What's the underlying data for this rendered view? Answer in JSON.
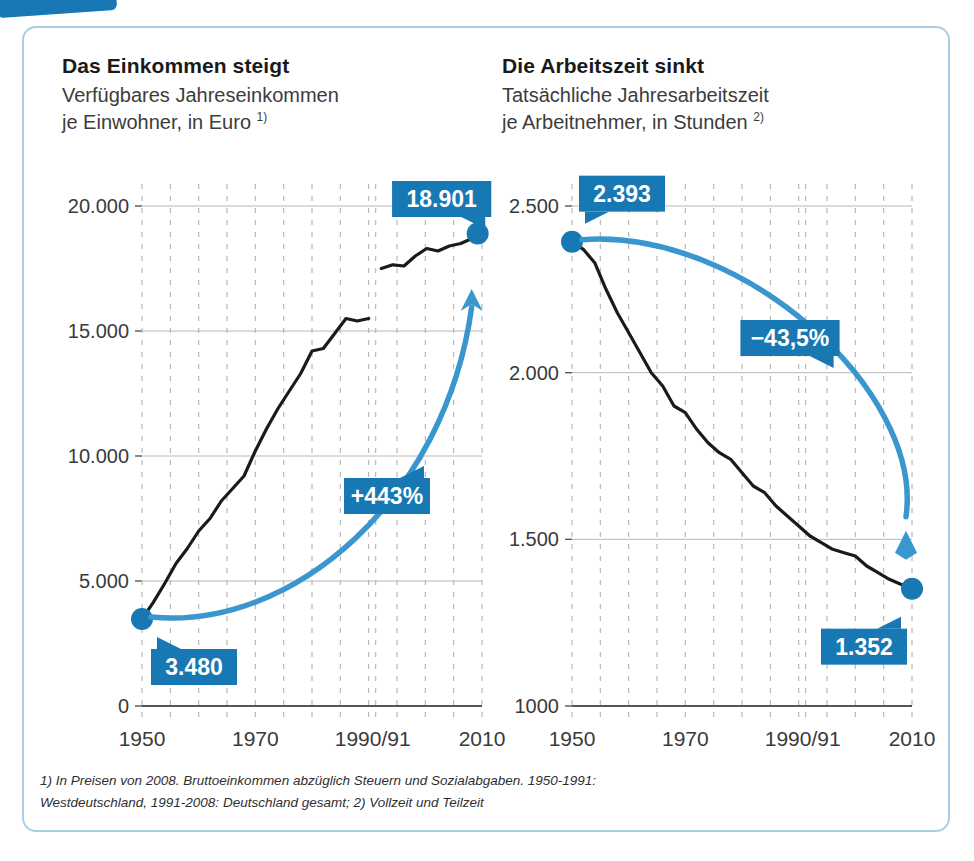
{
  "accent": {
    "badge_blue": "#1878b4",
    "arrow_blue": "#3a96ce",
    "line_black": "#1a1a1a",
    "grid_gray": "#b8b8b8",
    "axis_gray": "#555555",
    "card_border": "#a9cfe5"
  },
  "panels": [
    {
      "id": "einkommen",
      "title": "Das Einkommen steigt",
      "subtitle_line1": "Verfügbares Jahreseinkommen",
      "subtitle_line2": "je Einwohner, in Euro",
      "footnote_marker": "1)"
    },
    {
      "id": "arbeitszeit",
      "title": "Die Arbeitszeit sinkt",
      "subtitle_line1": "Tatsächliche Jahresarbeitszeit",
      "subtitle_line2": "je Arbeitnehmer, in Stunden",
      "footnote_marker": "2)"
    }
  ],
  "footnote": {
    "line1": "1) In Preisen von 2008. Bruttoeinkommen abzüglich Steuern und Sozialabgaben. 1950-1991:",
    "line2": "Westdeutschland, 1991-2008: Deutschland gesamt; 2) Vollzeit und Teilzeit"
  },
  "chart_data": [
    {
      "type": "line",
      "id": "einkommen",
      "title": "Das Einkommen steigt",
      "subtitle": "Verfügbares Jahreseinkommen je Einwohner, in Euro",
      "xlabel": "",
      "ylabel": "Euro",
      "ylim": [
        0,
        20000
      ],
      "xlim": [
        1950,
        2010
      ],
      "yticks": [
        0,
        5000,
        10000,
        15000,
        20000
      ],
      "ytick_labels": [
        "0",
        "5.000",
        "10.000",
        "15.000",
        "20.000"
      ],
      "xticks": [
        1950,
        1970,
        1990,
        2010
      ],
      "xtick_labels": [
        "1950",
        "1970",
        "1990/91",
        "2010"
      ],
      "grid": true,
      "grid_style": "dashed-vertical-and-solid-horizontal",
      "series_break_at": "1990/91",
      "start_value": 3480,
      "end_value": 18901,
      "change_label": "+443%",
      "start_label": "3.480",
      "end_label": "18.901",
      "x": [
        1950,
        1952,
        1954,
        1956,
        1958,
        1960,
        1962,
        1964,
        1966,
        1968,
        1970,
        1972,
        1974,
        1976,
        1978,
        1980,
        1982,
        1984,
        1986,
        1988,
        1990,
        1991,
        1993,
        1995,
        1997,
        1999,
        2001,
        2003,
        2005,
        2007,
        2008
      ],
      "values": [
        3480,
        4150,
        4900,
        5700,
        6300,
        7000,
        7500,
        8200,
        8700,
        9200,
        10200,
        11100,
        11900,
        12600,
        13300,
        14200,
        14300,
        14900,
        15500,
        15400,
        15500,
        17500,
        17650,
        17600,
        18000,
        18300,
        18200,
        18400,
        18500,
        18700,
        18901
      ]
    },
    {
      "type": "line",
      "id": "arbeitszeit",
      "title": "Die Arbeitszeit sinkt",
      "subtitle": "Tatsächliche Jahresarbeitszeit je Arbeitnehmer, in Stunden",
      "xlabel": "",
      "ylabel": "Stunden",
      "ylim": [
        1000,
        2500
      ],
      "xlim": [
        1950,
        2010
      ],
      "yticks": [
        1000,
        1500,
        2000,
        2500
      ],
      "ytick_labels": [
        "1000",
        "1.500",
        "2.000",
        "2.500"
      ],
      "xticks": [
        1950,
        1970,
        1990,
        2010
      ],
      "xtick_labels": [
        "1950",
        "1970",
        "1990/91",
        "2010"
      ],
      "grid": true,
      "grid_style": "dashed-vertical-and-solid-horizontal",
      "start_value": 2393,
      "end_value": 1352,
      "change_label": "−43,5%",
      "start_label": "2.393",
      "end_label": "1.352",
      "x": [
        1950,
        1952,
        1954,
        1956,
        1958,
        1960,
        1962,
        1964,
        1966,
        1968,
        1970,
        1972,
        1974,
        1976,
        1978,
        1980,
        1982,
        1984,
        1986,
        1988,
        1990,
        1992,
        1994,
        1996,
        1998,
        2000,
        2002,
        2004,
        2006,
        2008,
        2010
      ],
      "values": [
        2393,
        2370,
        2330,
        2250,
        2180,
        2120,
        2060,
        2000,
        1960,
        1900,
        1880,
        1830,
        1790,
        1760,
        1740,
        1700,
        1660,
        1640,
        1600,
        1570,
        1540,
        1510,
        1490,
        1470,
        1460,
        1450,
        1420,
        1400,
        1380,
        1365,
        1352
      ]
    }
  ]
}
